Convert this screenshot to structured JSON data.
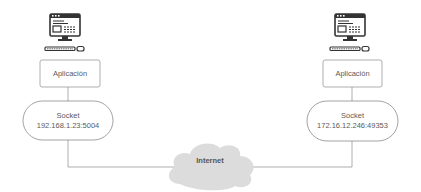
{
  "diagram": {
    "left": {
      "computer_icon": "desktop-computer-icon",
      "app_label": "Aplicación",
      "socket_title": "Socket",
      "socket_address": "192.168.1.23:5004"
    },
    "right": {
      "computer_icon": "desktop-computer-icon",
      "app_label": "Aplicación",
      "socket_title": "Socket",
      "socket_address": "172.16.12.246:49353"
    },
    "network": {
      "label": "Internet",
      "icon": "cloud-icon"
    },
    "colors": {
      "stroke": "#8a8a8a",
      "cloud_fill": "#dcdcdc",
      "text": "#5a5a5a"
    }
  }
}
